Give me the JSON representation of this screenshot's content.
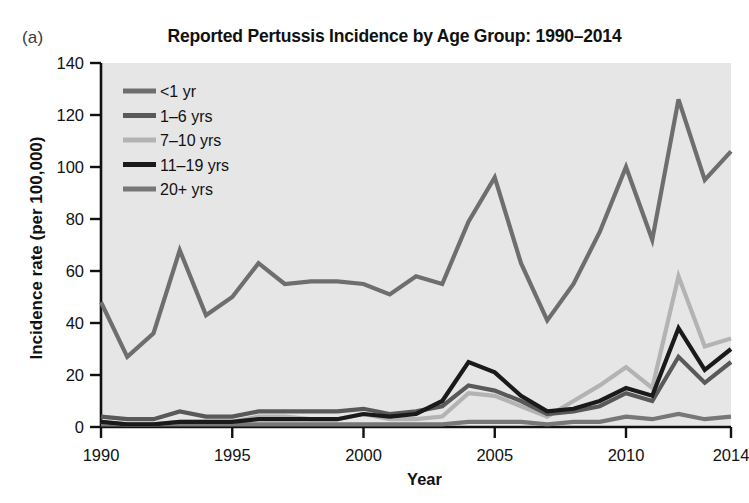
{
  "panel": {
    "label": "(a)"
  },
  "chart_data": {
    "type": "line",
    "title": "Reported Pertussis Incidence by Age Group: 1990–2014",
    "xlabel": "Year",
    "ylabel": "Incidence rate (per 100,000)",
    "xlim": [
      1990,
      2014
    ],
    "ylim": [
      0,
      140
    ],
    "yticks": [
      0,
      20,
      40,
      60,
      80,
      100,
      120,
      140
    ],
    "xticks": [
      1990,
      1995,
      2000,
      2005,
      2010,
      2014
    ],
    "grid": false,
    "legend_position": "top-left",
    "plot_background": "#e6e6e6",
    "x": [
      1990,
      1991,
      1992,
      1993,
      1994,
      1995,
      1996,
      1997,
      1998,
      1999,
      2000,
      2001,
      2002,
      2003,
      2004,
      2005,
      2006,
      2007,
      2008,
      2009,
      2010,
      2011,
      2012,
      2013,
      2014
    ],
    "series": [
      {
        "name": "<1 yr",
        "color": "#6e6e6e",
        "values": [
          48,
          27,
          36,
          68,
          43,
          50,
          63,
          55,
          56,
          56,
          55,
          51,
          58,
          55,
          79,
          96,
          63,
          41,
          55,
          75,
          100,
          72,
          126,
          95,
          106
        ]
      },
      {
        "name": "1–6 yrs",
        "color": "#595959",
        "values": [
          4,
          3,
          3,
          6,
          4,
          4,
          6,
          6,
          6,
          6,
          7,
          5,
          6,
          8,
          16,
          14,
          10,
          5,
          6,
          8,
          13,
          10,
          27,
          17,
          25
        ]
      },
      {
        "name": "7–10 yrs",
        "color": "#b3b3b3",
        "values": [
          2,
          1,
          1,
          2,
          2,
          2,
          4,
          4,
          3,
          3,
          5,
          3,
          3,
          4,
          13,
          12,
          8,
          4,
          10,
          16,
          23,
          15,
          58,
          31,
          34
        ]
      },
      {
        "name": "11–19 yrs",
        "color": "#1a1a1a",
        "values": [
          2,
          1,
          1,
          2,
          2,
          2,
          3,
          3,
          3,
          3,
          5,
          4,
          5,
          10,
          25,
          21,
          12,
          6,
          7,
          10,
          15,
          12,
          38,
          22,
          30
        ]
      },
      {
        "name": "20+ yrs",
        "color": "#777777",
        "values": [
          1,
          1,
          1,
          1,
          1,
          1,
          1,
          1,
          1,
          1,
          1,
          1,
          1,
          1,
          2,
          2,
          2,
          1,
          2,
          2,
          4,
          3,
          5,
          3,
          4
        ]
      }
    ]
  }
}
